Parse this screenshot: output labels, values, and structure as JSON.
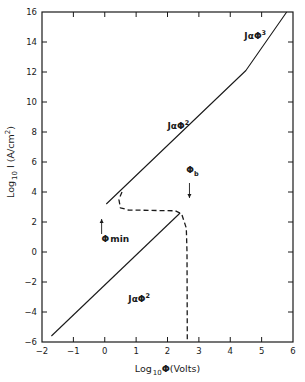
{
  "chart_data": {
    "type": "line",
    "title": "",
    "xlabel": "Log10 Φ (Volts)",
    "ylabel": "Log10 I (A/cm²)",
    "xlabel_parts": {
      "main": "Log",
      "sub": "10",
      "symbol": "Φ",
      "unit": "(Volts)"
    },
    "ylabel_parts": {
      "main": "Log",
      "sub": "10",
      "rest": " I (A/cm",
      "sup": "2",
      "close": ")"
    },
    "xlim": [
      -2,
      6
    ],
    "ylim": [
      -6,
      16
    ],
    "xticks": [
      -2,
      -1,
      0,
      1,
      2,
      3,
      4,
      5,
      6
    ],
    "yticks": [
      -6,
      -4,
      -2,
      0,
      2,
      4,
      6,
      8,
      10,
      12,
      14,
      16
    ],
    "grid": false,
    "legend": null,
    "series": [
      {
        "name": "lower branch (J ∝ Φ²)",
        "style": "solid",
        "points": [
          [
            -1.7,
            -5.6
          ],
          [
            2.4,
            2.6
          ]
        ]
      },
      {
        "name": "upper branch (J ∝ Φ² then J ∝ Φ³)",
        "style": "solid",
        "points": [
          [
            0.05,
            3.2
          ],
          [
            4.5,
            12.1
          ],
          [
            5.8,
            16.0
          ]
        ]
      },
      {
        "name": "transition path",
        "style": "dashed",
        "points": [
          [
            0.55,
            4.0
          ],
          [
            0.45,
            3.5
          ],
          [
            0.5,
            2.95
          ],
          [
            0.75,
            2.8
          ],
          [
            2.25,
            2.75
          ],
          [
            2.45,
            2.55
          ],
          [
            2.6,
            1.6
          ],
          [
            2.62,
            0.0
          ],
          [
            2.63,
            -6.0
          ]
        ]
      }
    ],
    "annotations": [
      {
        "id": "j-phi3",
        "text": "J",
        "alpha": "α",
        "symbol": "Φ",
        "exp": "3",
        "x": 4.45,
        "y": 14.2
      },
      {
        "id": "j-phi2-upper",
        "text": "J",
        "alpha": "α",
        "symbol": "Φ",
        "exp": "2",
        "x": 2.0,
        "y": 8.2
      },
      {
        "id": "j-phi2-lower",
        "text": "J",
        "alpha": "α",
        "symbol": "Φ",
        "exp": "2",
        "x": 0.75,
        "y": -3.3
      },
      {
        "id": "phi-b",
        "symbol": "Φ",
        "sub": "b",
        "x": 2.6,
        "y": 5.3,
        "arrow": {
          "from": [
            2.7,
            4.6
          ],
          "to": [
            2.7,
            3.6
          ]
        }
      },
      {
        "id": "phi-min",
        "symbol": "Φ",
        "sub": "min",
        "x": -0.1,
        "y": 0.7,
        "arrow": {
          "from": [
            -0.1,
            1.2
          ],
          "to": [
            -0.1,
            2.2
          ]
        }
      }
    ]
  },
  "colors": {
    "ink": "#1a1a1a",
    "background": "#ffffff"
  }
}
